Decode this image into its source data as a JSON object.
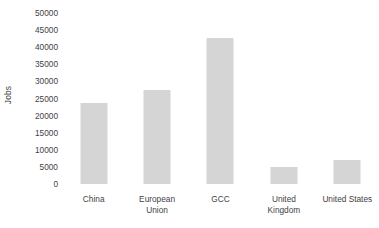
{
  "chart_data": {
    "type": "bar",
    "title": "",
    "subtitle": "",
    "xlabel": "",
    "ylabel": "Jobs",
    "categories": [
      "China",
      "European Union",
      "GCC",
      "United Kingdom",
      "United States"
    ],
    "values": [
      23700,
      27400,
      42700,
      5000,
      7100
    ],
    "series": [
      {
        "name": "Jobs",
        "values": [
          23700,
          27400,
          42700,
          5000,
          7100
        ]
      }
    ],
    "ylim": [
      0,
      50000
    ],
    "ytick_values": [
      0,
      5000,
      10000,
      15000,
      20000,
      25000,
      30000,
      35000,
      40000,
      45000,
      50000
    ],
    "ytick_labels": [
      "0",
      "5000",
      "10000",
      "15000",
      "20000",
      "25000",
      "30000",
      "35000",
      "40000",
      "45000",
      "50000"
    ],
    "grid": false,
    "legend": false,
    "legend_position": "none",
    "bar_color": "#d5d5d5",
    "background_color": "#ffffff",
    "text_color": "#3f3f3f"
  },
  "axis": {
    "y_title": "Jobs"
  },
  "categories_wrapped": [
    {
      "lines": [
        "China"
      ]
    },
    {
      "lines": [
        "European",
        "Union"
      ]
    },
    {
      "lines": [
        "GCC"
      ]
    },
    {
      "lines": [
        "United",
        "Kingdom"
      ]
    },
    {
      "lines": [
        "United States"
      ]
    }
  ]
}
